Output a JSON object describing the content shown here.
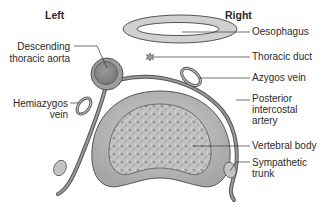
{
  "sides": {
    "left": "Left",
    "right": "Right"
  },
  "labels": {
    "oesophagus": "Oesophagus",
    "thoracic_duct": "Thoracic duct",
    "azygos_vein": "Azygos vein",
    "posterior_intercostal_artery_1": "Posterior",
    "posterior_intercostal_artery_2": "intercostal",
    "posterior_intercostal_artery_3": "artery",
    "vertebral_body": "Vertebral body",
    "sympathetic_trunk_1": "Sympathetic",
    "sympathetic_trunk_2": "trunk",
    "descending_aorta_1": "Descending",
    "descending_aorta_2": "thoracic aorta",
    "hemiazygos_vein_1": "Hemiazygos",
    "hemiazygos_vein_2": "vein"
  },
  "colors": {
    "outline": "#555555",
    "fill_light": "#c8c8c8",
    "fill_mid": "#a8a8a8",
    "fill_dark": "#8e8e8e",
    "leader": "#333333"
  }
}
